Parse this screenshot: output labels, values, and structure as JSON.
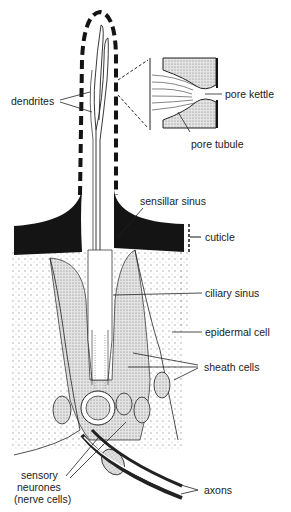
{
  "diagram": {
    "labels": {
      "dendrites": "dendrites",
      "pore_kettle": "pore kettle",
      "pore_tubule": "pore tubule",
      "sensillar_sinus": "sensillar sinus",
      "cuticle": "cuticle",
      "ciliary_sinus": "ciliary sinus",
      "epidermal_cell": "epidermal cell",
      "sheath_cells": "sheath cells",
      "sensory_neurones_1": "sensory",
      "sensory_neurones_2": "neurones",
      "sensory_neurones_3": "(nerve cells)",
      "axons": "axons"
    },
    "colors": {
      "ink": "#1a1a1a",
      "cuticle": "#141414",
      "stipple": "#cfcfcf",
      "background": "#ffffff"
    }
  }
}
